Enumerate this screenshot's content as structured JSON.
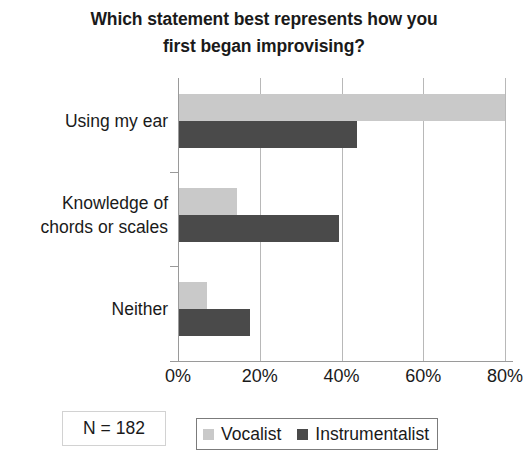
{
  "chart_data": {
    "type": "bar",
    "orientation": "horizontal",
    "title": "Which statement best represents how you first began improvising?",
    "title_lines": [
      "Which statement best represents how you",
      "first began improvising?"
    ],
    "xlabel": "",
    "ylabel": "",
    "xlim": [
      0,
      80
    ],
    "xticks": [
      0,
      20,
      40,
      60,
      80
    ],
    "xtick_labels": [
      "0%",
      "20%",
      "40%",
      "60%",
      "80%"
    ],
    "grid": true,
    "grid_axis": "x",
    "legend_position": "bottom",
    "categories": [
      "Using my ear",
      "Knowledge of chords or scales",
      "Neither"
    ],
    "category_label_lines": [
      [
        "Using my ear"
      ],
      [
        "Knowledge of",
        "chords or scales"
      ],
      [
        "Neither"
      ]
    ],
    "series": [
      {
        "name": "Vocalist",
        "color": "#c9c9c9",
        "values": [
          80,
          14.5,
          7
        ]
      },
      {
        "name": "Instrumentalist",
        "color": "#4a4a4a",
        "values": [
          43.7,
          39.5,
          17.5
        ]
      }
    ],
    "annotations": [
      {
        "name": "sample-size",
        "text": "N = 182"
      }
    ]
  },
  "footer": {
    "sample_size_label": "N = 182"
  },
  "colors": {
    "vocalist": "#c9c9c9",
    "instrumentalist": "#4a4a4a",
    "grid": "#b8b8b8",
    "axis": "#9a9a9a",
    "text": "#1a1a1a"
  }
}
